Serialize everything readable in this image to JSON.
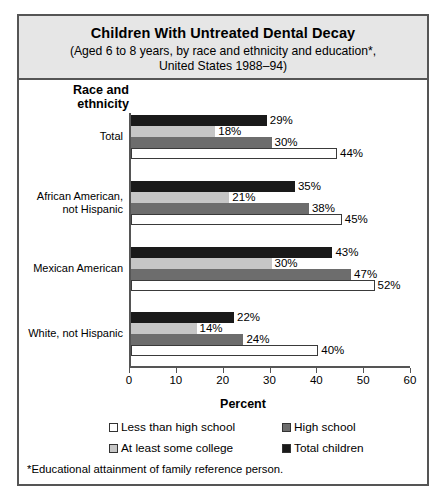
{
  "title": {
    "main": "Children With Untreated Dental Decay",
    "sub_line1": "(Aged 6 to 8 years, by race and ethnicity and education*,",
    "sub_line2": "United States 1988–94)"
  },
  "axis_title": {
    "line1": "Race and",
    "line2": "ethnicity"
  },
  "xlabel": "Percent",
  "footnote": "*Educational attainment of family reference person.",
  "legend": [
    {
      "label": "Less than high school",
      "swatch": "sw-lesshs",
      "icon": "legend-swatch-white"
    },
    {
      "label": "High school",
      "swatch": "sw-highsch",
      "icon": "legend-swatch-dark-gray"
    },
    {
      "label": "At least some college",
      "swatch": "sw-college",
      "icon": "legend-swatch-light-gray"
    },
    {
      "label": "Total children",
      "swatch": "sw-total",
      "icon": "legend-swatch-black"
    }
  ],
  "ticks": [
    "0",
    "10",
    "20",
    "30",
    "40",
    "50",
    "60"
  ],
  "groups": [
    {
      "label_line1": "Total",
      "label_line2": "",
      "bars": [
        {
          "series": "Total children",
          "value": 29,
          "text": "29%"
        },
        {
          "series": "At least some college",
          "value": 18,
          "text": "18%"
        },
        {
          "series": "High school",
          "value": 30,
          "text": "30%"
        },
        {
          "series": "Less than high school",
          "value": 44,
          "text": "44%"
        }
      ]
    },
    {
      "label_line1": "African American,",
      "label_line2": "not Hispanic",
      "bars": [
        {
          "series": "Total children",
          "value": 35,
          "text": "35%"
        },
        {
          "series": "At least some college",
          "value": 21,
          "text": "21%"
        },
        {
          "series": "High school",
          "value": 38,
          "text": "38%"
        },
        {
          "series": "Less than high school",
          "value": 45,
          "text": "45%"
        }
      ]
    },
    {
      "label_line1": "Mexican American",
      "label_line2": "",
      "bars": [
        {
          "series": "Total children",
          "value": 43,
          "text": "43%"
        },
        {
          "series": "At least some college",
          "value": 30,
          "text": "30%"
        },
        {
          "series": "High school",
          "value": 47,
          "text": "47%"
        },
        {
          "series": "Less than high school",
          "value": 52,
          "text": "52%"
        }
      ]
    },
    {
      "label_line1": "White, not Hispanic",
      "label_line2": "",
      "bars": [
        {
          "series": "Total children",
          "value": 22,
          "text": "22%"
        },
        {
          "series": "At least some college",
          "value": 14,
          "text": "14%"
        },
        {
          "series": "High school",
          "value": 24,
          "text": "24%"
        },
        {
          "series": "Less than high school",
          "value": 40,
          "text": "40%"
        }
      ]
    }
  ],
  "colors": {
    "total_children": "#1a1a1a",
    "high_school": "#6d6d6d",
    "some_college": "#c6c6c6",
    "less_than_high_school": "#ffffff",
    "frame": "#555555",
    "title_background": "#e6e6e6"
  },
  "chart_data": {
    "type": "bar",
    "orientation": "horizontal",
    "title": "Children With Untreated Dental Decay",
    "subtitle": "(Aged 6 to 8 years, by race and ethnicity and education*, United States 1988–94)",
    "xlabel": "Percent",
    "ylabel": "Race and ethnicity",
    "xlim": [
      0,
      60
    ],
    "xticks": [
      0,
      10,
      20,
      30,
      40,
      50,
      60
    ],
    "grid": false,
    "legend_position": "below-axis",
    "categories": [
      "Total",
      "African American, not Hispanic",
      "Mexican American",
      "White, not Hispanic"
    ],
    "series": [
      {
        "name": "Total children",
        "values": [
          29,
          35,
          43,
          22
        ],
        "color": "#1a1a1a"
      },
      {
        "name": "At least some college",
        "values": [
          18,
          21,
          30,
          14
        ],
        "color": "#c6c6c6"
      },
      {
        "name": "High school",
        "values": [
          30,
          38,
          47,
          24
        ],
        "color": "#6d6d6d"
      },
      {
        "name": "Less than high school",
        "values": [
          44,
          45,
          52,
          40
        ],
        "color": "#ffffff"
      }
    ],
    "annotations": [
      "*Educational attainment of family reference person."
    ]
  }
}
